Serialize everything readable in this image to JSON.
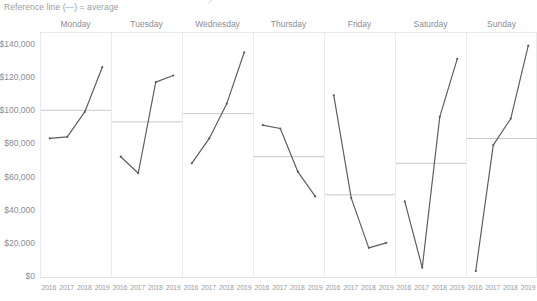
{
  "title_remnant": "y",
  "legend": {
    "reference_note": "Reference line (—) = average"
  },
  "axis": {
    "y_ticks": [
      "$140,000",
      "$120,000",
      "$100,000",
      "$80,000",
      "$60,000",
      "$40,000",
      "$20,000",
      "$0"
    ],
    "x_ticks": [
      "2016",
      "2017",
      "2018",
      "2019"
    ]
  },
  "colors": {
    "line": "#5a5d61",
    "reference_line": "#c6c8cb",
    "grid": "#ececee",
    "text": "#8b8e93"
  },
  "chart_data": {
    "type": "line",
    "title": "",
    "subtitle": "Reference line (—) = average",
    "xlabel": "",
    "ylabel": "",
    "x": [
      2016,
      2017,
      2018,
      2019
    ],
    "ylim": [
      0,
      145000
    ],
    "y_ticks": [
      0,
      20000,
      40000,
      60000,
      80000,
      100000,
      120000,
      140000
    ],
    "grid": true,
    "legend_position": "none",
    "facet_by": "day-of-week",
    "reference_line_label": "average",
    "series": [
      {
        "name": "Monday",
        "values": [
          83000,
          84000,
          99000,
          126000
        ],
        "reference_line": 100000
      },
      {
        "name": "Tuesday",
        "values": [
          72000,
          62000,
          117000,
          121000
        ],
        "reference_line": 93000
      },
      {
        "name": "Wednesday",
        "values": [
          68000,
          83000,
          104000,
          135000
        ],
        "reference_line": 98000
      },
      {
        "name": "Thursday",
        "values": [
          91000,
          89000,
          63000,
          48000
        ],
        "reference_line": 72000
      },
      {
        "name": "Friday",
        "values": [
          109000,
          47000,
          17000,
          20000
        ],
        "reference_line": 49000
      },
      {
        "name": "Saturday",
        "values": [
          45000,
          5000,
          96000,
          131000
        ],
        "reference_line": 68000
      },
      {
        "name": "Sunday",
        "values": [
          3000,
          79000,
          95000,
          139000
        ],
        "reference_line": 83000
      }
    ]
  }
}
